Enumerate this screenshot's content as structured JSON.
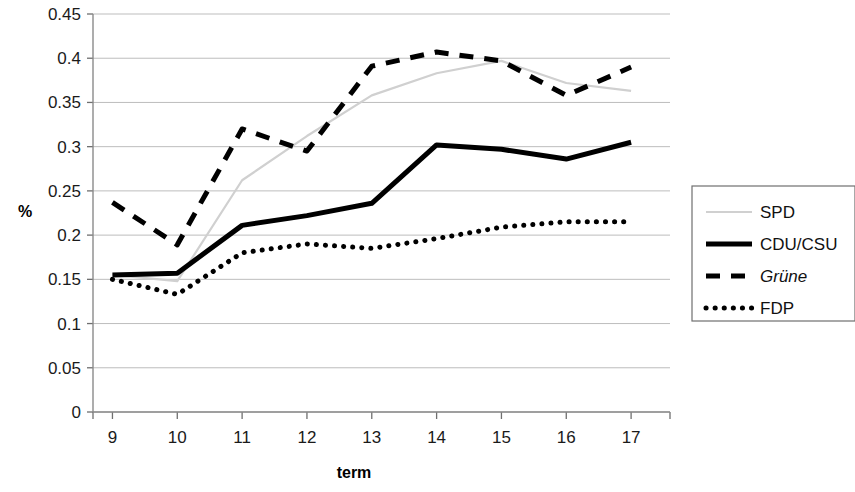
{
  "chart_data": {
    "type": "line",
    "title": "",
    "xlabel": "term",
    "ylabel": "%",
    "x": [
      9,
      10,
      11,
      12,
      13,
      14,
      15,
      16,
      17
    ],
    "categories": [
      "9",
      "10",
      "11",
      "12",
      "13",
      "14",
      "15",
      "16",
      "17"
    ],
    "xlim": [
      8.7,
      17.6
    ],
    "ylim": [
      0,
      0.45
    ],
    "y_ticks": [
      "0",
      "0.05",
      "0.1",
      "0.15",
      "0.2",
      "0.25",
      "0.3",
      "0.35",
      "0.4",
      "0.45"
    ],
    "y_tick_values": [
      0,
      0.05,
      0.1,
      0.15,
      0.2,
      0.25,
      0.3,
      0.35,
      0.4,
      0.45
    ],
    "grid": "horizontal",
    "legend_position": "right",
    "series": [
      {
        "name": "SPD",
        "style": "solid-thin",
        "color": "#d0d0d0",
        "values": [
          0.155,
          0.148,
          0.262,
          0.312,
          0.358,
          0.383,
          0.397,
          0.372,
          0.363
        ]
      },
      {
        "name": "CDU/CSU",
        "style": "solid-thick",
        "color": "#000000",
        "values": [
          0.155,
          0.157,
          0.211,
          0.222,
          0.236,
          0.302,
          0.297,
          0.286,
          0.305
        ]
      },
      {
        "name": "Grüne",
        "style": "dashed",
        "color": "#000000",
        "italic_label": true,
        "values": [
          0.237,
          0.189,
          0.32,
          0.295,
          0.391,
          0.407,
          0.397,
          0.358,
          0.39
        ]
      },
      {
        "name": "FDP",
        "style": "dotted",
        "color": "#000000",
        "values": [
          0.15,
          0.133,
          0.18,
          0.19,
          0.185,
          0.196,
          0.209,
          0.215,
          0.215
        ]
      }
    ]
  },
  "legend": {
    "items": [
      {
        "label": "SPD"
      },
      {
        "label": "CDU/CSU"
      },
      {
        "label": "Grüne"
      },
      {
        "label": "FDP"
      }
    ]
  },
  "axes": {
    "y_title": "%",
    "x_title": "term"
  }
}
